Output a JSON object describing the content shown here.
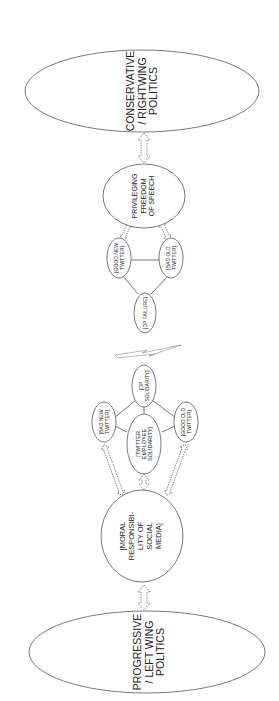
{
  "diagram": {
    "type": "concept-map",
    "orientation": "rotated-90-ccw",
    "nodes": {
      "conservative": {
        "lines": [
          "CONSERVATIVE",
          "/ RIGHTWING",
          "POLITICS"
        ]
      },
      "freedom": {
        "lines": [
          "PRIVILEGING",
          "FREEDOM",
          "OF SPEECH"
        ]
      },
      "good_new": {
        "lines": [
          "[GOOD NEW",
          "TWITTER]"
        ]
      },
      "bad_old": {
        "lines": [
          "[BAD OLD",
          "TWITTER]"
        ]
      },
      "dp_failure": {
        "lines": [
          "[DP FAILURE]"
        ]
      },
      "dp_solidarity": {
        "lines": [
          "[DP",
          "SOLIDARITY]"
        ]
      },
      "bad_new": {
        "lines": [
          "[BAD NEW",
          "TWITTER]"
        ]
      },
      "good_old": {
        "lines": [
          "[GOOD OLD",
          "TWITTER]"
        ]
      },
      "employee": {
        "lines": [
          "[TWITTER",
          "EMPLOYEE",
          "SOLIDARITY]"
        ]
      },
      "moral": {
        "lines": [
          "[MORAL",
          "RESPONSIBI-",
          "LITY OF",
          "SOCIAL",
          "MEDIA]"
        ]
      },
      "progressive": {
        "lines": [
          "PROGRESSIVE",
          "/ LEFT WING",
          "POLITICS"
        ]
      }
    },
    "edges": [
      {
        "from": "conservative",
        "to": "freedom",
        "style": "double-arrow"
      },
      {
        "from": "freedom",
        "to": "good_new",
        "style": "double-arrow"
      },
      {
        "from": "freedom",
        "to": "bad_old",
        "style": "double-arrow"
      },
      {
        "from": "good_new",
        "to": "bad_old",
        "style": "line"
      },
      {
        "from": "good_new",
        "to": "dp_failure",
        "style": "line"
      },
      {
        "from": "bad_old",
        "to": "dp_failure",
        "style": "line"
      },
      {
        "from": "dp_failure",
        "to": "dp_solidarity",
        "style": "lightning-break"
      },
      {
        "from": "dp_solidarity",
        "to": "bad_new",
        "style": "line"
      },
      {
        "from": "dp_solidarity",
        "to": "good_old",
        "style": "line"
      },
      {
        "from": "dp_solidarity",
        "to": "employee",
        "style": "line"
      },
      {
        "from": "employee",
        "to": "bad_new",
        "style": "line"
      },
      {
        "from": "employee",
        "to": "good_old",
        "style": "line"
      },
      {
        "from": "bad_new",
        "to": "moral",
        "style": "double-arrow"
      },
      {
        "from": "good_old",
        "to": "moral",
        "style": "double-arrow"
      },
      {
        "from": "employee",
        "to": "moral",
        "style": "double-arrow"
      },
      {
        "from": "moral",
        "to": "progressive",
        "style": "double-arrow"
      }
    ]
  }
}
